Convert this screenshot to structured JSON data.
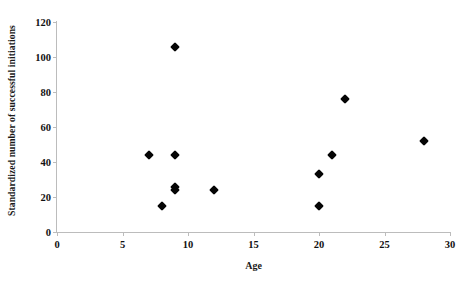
{
  "chart_data": {
    "type": "scatter",
    "title": "",
    "xlabel": "Age",
    "ylabel": "Standardized number of successful initiations",
    "xlim": [
      0,
      30
    ],
    "ylim": [
      0,
      120
    ],
    "xticks": [
      0,
      5,
      10,
      15,
      20,
      25,
      30
    ],
    "yticks": [
      0,
      20,
      40,
      60,
      80,
      100,
      120
    ],
    "xtick_labels": [
      "0",
      "5",
      "10",
      "15",
      "20",
      "25",
      "30"
    ],
    "ytick_labels": [
      "0",
      "20",
      "40",
      "60",
      "80",
      "100",
      "120"
    ],
    "grid": false,
    "legend": null,
    "marker": "diamond",
    "marker_color": "#050505",
    "axis_color": "#bcbcbc",
    "series": [
      {
        "name": "observations",
        "points": [
          {
            "x": 7,
            "y": 44
          },
          {
            "x": 8,
            "y": 15
          },
          {
            "x": 9,
            "y": 106
          },
          {
            "x": 9,
            "y": 44
          },
          {
            "x": 9,
            "y": 26
          },
          {
            "x": 9,
            "y": 24
          },
          {
            "x": 12,
            "y": 24
          },
          {
            "x": 20,
            "y": 33
          },
          {
            "x": 20,
            "y": 15
          },
          {
            "x": 21,
            "y": 44
          },
          {
            "x": 22,
            "y": 76
          },
          {
            "x": 28,
            "y": 52
          }
        ]
      }
    ]
  }
}
